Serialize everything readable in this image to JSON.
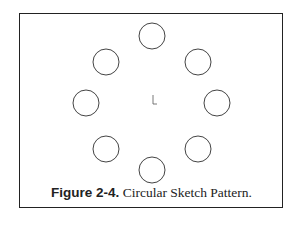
{
  "figure": {
    "caption_label": "Figure 2-4.",
    "caption_text": " Circular Sketch Pattern.",
    "pattern": {
      "type": "circular",
      "instance_count": 8,
      "center": [
        152,
        103
      ],
      "pattern_radius": 66,
      "circle_radius": 13
    },
    "stroke_color": "#333333"
  }
}
